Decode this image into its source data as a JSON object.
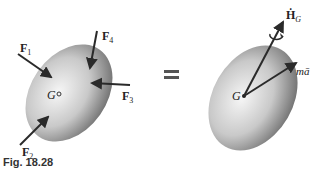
{
  "figure": {
    "caption": "Fig. 18.28",
    "left_body": {
      "forces": [
        {
          "name": "F",
          "sub": "1"
        },
        {
          "name": "F",
          "sub": "2"
        },
        {
          "name": "F",
          "sub": "3"
        },
        {
          "name": "F",
          "sub": "4"
        }
      ],
      "center_label": "G"
    },
    "equals_sign": "=",
    "right_body": {
      "center_label": "G",
      "angular_momentum_rate": {
        "name": "Ḣ",
        "sub": "G"
      },
      "linear_term": "mā"
    },
    "colors": {
      "arrow": "#2a2a2a",
      "body_light": "#f4f4f4",
      "body_dark": "#7d7d7d"
    }
  }
}
